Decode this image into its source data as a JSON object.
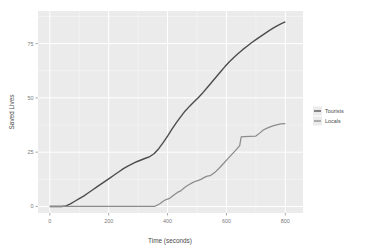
{
  "chart_data": {
    "type": "line",
    "title": "",
    "xlabel": "Time (seconds)",
    "ylabel": "Saved Lives",
    "xlim": [
      -40,
      860
    ],
    "ylim": [
      -3,
      90
    ],
    "grid": true,
    "legend_position": "right",
    "x_ticks": [
      0,
      200,
      400,
      600,
      800
    ],
    "x_tick_labels": [
      "0",
      "200",
      "400",
      "600",
      "800"
    ],
    "y_ticks": [
      0,
      25,
      50,
      75
    ],
    "y_tick_labels": [
      "0",
      "25",
      "50",
      "75"
    ],
    "series": [
      {
        "name": "Tourists",
        "color": "#4d4d4d",
        "x": [
          0,
          20,
          40,
          55,
          70,
          85,
          100,
          115,
          130,
          145,
          160,
          175,
          190,
          205,
          220,
          235,
          250,
          265,
          280,
          295,
          310,
          325,
          340,
          355,
          370,
          385,
          400,
          415,
          430,
          445,
          460,
          475,
          490,
          505,
          520,
          535,
          550,
          565,
          580,
          595,
          610,
          625,
          640,
          655,
          670,
          685,
          700,
          715,
          730,
          745,
          760,
          775,
          790,
          800
        ],
        "values": [
          0,
          0,
          0,
          0.3,
          1.2,
          2.4,
          3.6,
          4.8,
          6.2,
          7.6,
          9.0,
          10.4,
          11.8,
          13.2,
          14.6,
          16.0,
          17.4,
          18.6,
          19.6,
          20.6,
          21.4,
          22.2,
          23.0,
          24.4,
          26.6,
          29.4,
          32.4,
          35.6,
          38.6,
          41.4,
          44.0,
          46.2,
          48.2,
          50.2,
          52.4,
          54.8,
          57.2,
          59.6,
          62.0,
          64.4,
          66.6,
          68.6,
          70.4,
          72.2,
          73.8,
          75.4,
          76.8,
          78.2,
          79.6,
          81.0,
          82.2,
          83.4,
          84.4,
          85.0
        ]
      },
      {
        "name": "Locals",
        "color": "#8c8c8c",
        "x": [
          0,
          100,
          200,
          300,
          355,
          365,
          375,
          385,
          395,
          405,
          415,
          425,
          435,
          445,
          455,
          465,
          475,
          485,
          495,
          505,
          515,
          525,
          535,
          545,
          560,
          575,
          590,
          605,
          620,
          635,
          645,
          650,
          660,
          680,
          700,
          715,
          725,
          740,
          755,
          770,
          785,
          800
        ],
        "values": [
          0,
          0,
          0,
          0,
          0,
          0.6,
          1.4,
          2.4,
          3.2,
          3.6,
          4.6,
          5.6,
          6.6,
          7.2,
          8.4,
          9.4,
          10.2,
          11.0,
          11.6,
          12.0,
          12.6,
          13.4,
          14.0,
          14.2,
          15.6,
          17.6,
          19.8,
          22.0,
          24.2,
          26.4,
          28.0,
          32.0,
          32.2,
          32.3,
          32.4,
          34.0,
          35.2,
          36.2,
          37.0,
          37.6,
          38.0,
          38.2
        ]
      }
    ]
  },
  "legend": {
    "entries": [
      {
        "label": "Tourists",
        "color": "#4d4d4d"
      },
      {
        "label": "Locals",
        "color": "#8c8c8c"
      }
    ]
  },
  "panel": {
    "background_color": "#ebebeb",
    "gridline_color": "#ffffff"
  }
}
